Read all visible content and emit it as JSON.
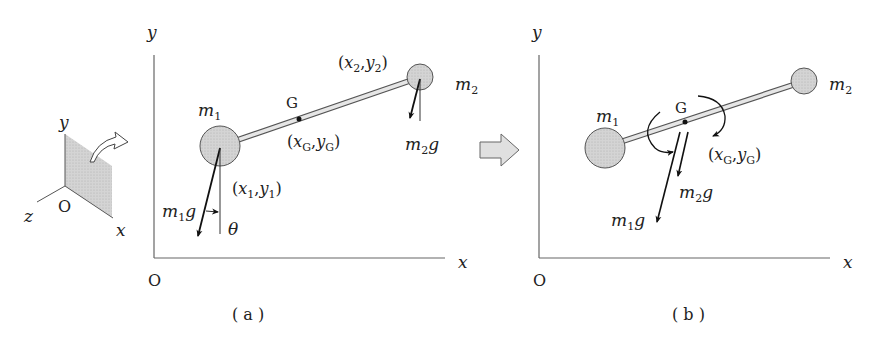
{
  "inset": {
    "axis_y": "y",
    "axis_x": "x",
    "axis_z": "z",
    "origin": "O"
  },
  "panel_a": {
    "caption": "( a )",
    "axis_y": "y",
    "axis_x": "x",
    "origin": "O",
    "m1": {
      "m": "m",
      "sub": "1"
    },
    "m2": {
      "m": "m",
      "sub": "2"
    },
    "G": "G",
    "coord1": {
      "open": "(",
      "x": "x",
      "xs": "1",
      "comma": ",",
      "y": "y",
      "ys": "1",
      "close": ")"
    },
    "coord2": {
      "open": "(",
      "x": "x",
      "xs": "2",
      "comma": ",",
      "y": "y",
      "ys": "2",
      "close": ")"
    },
    "coordG": {
      "open": "(",
      "x": "x",
      "xs": "G",
      "comma": ",",
      "y": "y",
      "ys": "G",
      "close": ")"
    },
    "force1": {
      "m": "m",
      "sub": "1",
      "g": "g"
    },
    "force2": {
      "m": "m",
      "sub": "2",
      "g": "g"
    },
    "theta": "θ"
  },
  "panel_b": {
    "caption": "( b )",
    "axis_y": "y",
    "axis_x": "x",
    "origin": "O",
    "m1": {
      "m": "m",
      "sub": "1"
    },
    "m2": {
      "m": "m",
      "sub": "2"
    },
    "G": "G",
    "coordG": {
      "open": "(",
      "x": "x",
      "xs": "G",
      "comma": ",",
      "y": "y",
      "ys": "G",
      "close": ")"
    },
    "force1": {
      "m": "m",
      "sub": "1",
      "g": "g"
    },
    "force2": {
      "m": "m",
      "sub": "2",
      "g": "g"
    }
  },
  "colors": {
    "mass_fill": "#c8c8c8",
    "plane_fill": "#d9d9d9",
    "line": "#444444",
    "arrow_fill": "#e0e0e0"
  }
}
